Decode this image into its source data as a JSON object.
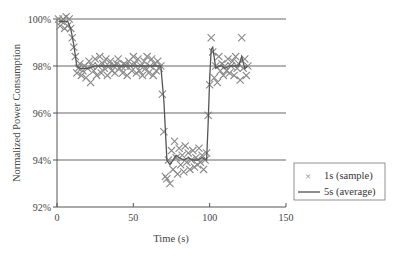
{
  "chart_data": {
    "type": "scatter",
    "title": "",
    "xlabel": "Time (s)",
    "ylabel": "Normalized Power Consumption",
    "xlim": [
      0,
      150
    ],
    "ylim": [
      92,
      100
    ],
    "x_ticks": [
      0,
      50,
      100,
      150
    ],
    "x_tick_labels": [
      "0",
      "50",
      "100",
      "150"
    ],
    "y_ticks": [
      92,
      94,
      96,
      98,
      100
    ],
    "y_tick_labels": [
      "92%",
      "94%",
      "96%",
      "98%",
      "100%"
    ],
    "grid": "horizontal",
    "legend_position": "right",
    "series": [
      {
        "name": "1s (sample)",
        "kind": "scatter",
        "marker": "x",
        "color": "#888888",
        "points": [
          [
            1,
            100.0
          ],
          [
            2,
            99.7
          ],
          [
            3,
            99.9
          ],
          [
            4,
            100.0
          ],
          [
            5,
            99.6
          ],
          [
            6,
            100.1
          ],
          [
            7,
            99.7
          ],
          [
            8,
            100.0
          ],
          [
            9,
            99.6
          ],
          [
            10,
            99.2
          ],
          [
            11,
            98.8
          ],
          [
            12,
            98.4
          ],
          [
            13,
            97.7
          ],
          [
            14,
            97.9
          ],
          [
            15,
            98.1
          ],
          [
            16,
            97.6
          ],
          [
            17,
            97.8
          ],
          [
            18,
            98.0
          ],
          [
            19,
            97.5
          ],
          [
            20,
            97.9
          ],
          [
            21,
            98.2
          ],
          [
            22,
            97.3
          ],
          [
            23,
            98.0
          ],
          [
            24,
            97.8
          ],
          [
            25,
            98.3
          ],
          [
            26,
            97.6
          ],
          [
            27,
            98.0
          ],
          [
            28,
            98.4
          ],
          [
            29,
            97.7
          ],
          [
            30,
            98.1
          ],
          [
            31,
            97.9
          ],
          [
            32,
            98.3
          ],
          [
            33,
            97.6
          ],
          [
            34,
            98.0
          ],
          [
            35,
            98.2
          ],
          [
            36,
            97.8
          ],
          [
            37,
            98.0
          ],
          [
            38,
            97.7
          ],
          [
            39,
            98.1
          ],
          [
            40,
            98.3
          ],
          [
            41,
            97.9
          ],
          [
            42,
            98.0
          ],
          [
            43,
            97.7
          ],
          [
            44,
            98.1
          ],
          [
            45,
            98.0
          ],
          [
            46,
            97.6
          ],
          [
            47,
            98.2
          ],
          [
            48,
            98.0
          ],
          [
            49,
            97.8
          ],
          [
            50,
            98.4
          ],
          [
            51,
            98.1
          ],
          [
            52,
            97.7
          ],
          [
            53,
            98.3
          ],
          [
            54,
            97.8
          ],
          [
            55,
            98.0
          ],
          [
            56,
            97.6
          ],
          [
            57,
            98.2
          ],
          [
            58,
            97.9
          ],
          [
            59,
            98.4
          ],
          [
            60,
            97.7
          ],
          [
            61,
            98.0
          ],
          [
            62,
            98.3
          ],
          [
            63,
            97.6
          ],
          [
            64,
            98.1
          ],
          [
            65,
            97.8
          ],
          [
            66,
            98.2
          ],
          [
            67,
            97.9
          ],
          [
            68,
            98.0
          ],
          [
            69,
            96.8
          ],
          [
            70,
            95.2
          ],
          [
            71,
            93.3
          ],
          [
            72,
            93.2
          ],
          [
            73,
            94.0
          ],
          [
            74,
            93.0
          ],
          [
            75,
            94.4
          ],
          [
            76,
            93.6
          ],
          [
            77,
            94.8
          ],
          [
            78,
            94.1
          ],
          [
            79,
            93.4
          ],
          [
            80,
            94.5
          ],
          [
            81,
            93.8
          ],
          [
            82,
            94.2
          ],
          [
            83,
            93.5
          ],
          [
            84,
            94.6
          ],
          [
            85,
            93.9
          ],
          [
            86,
            94.3
          ],
          [
            87,
            93.6
          ],
          [
            88,
            94.0
          ],
          [
            89,
            94.4
          ],
          [
            90,
            93.7
          ],
          [
            91,
            94.1
          ],
          [
            92,
            93.8
          ],
          [
            93,
            94.5
          ],
          [
            94,
            93.9
          ],
          [
            95,
            94.2
          ],
          [
            96,
            93.6
          ],
          [
            97,
            94.0
          ],
          [
            98,
            94.3
          ],
          [
            99,
            95.9
          ],
          [
            100,
            97.2
          ],
          [
            101,
            99.2
          ],
          [
            102,
            98.6
          ],
          [
            103,
            97.5
          ],
          [
            104,
            98.0
          ],
          [
            105,
            97.3
          ],
          [
            106,
            98.4
          ],
          [
            107,
            97.8
          ],
          [
            108,
            98.1
          ],
          [
            109,
            97.6
          ],
          [
            110,
            98.0
          ],
          [
            111,
            97.8
          ],
          [
            112,
            98.3
          ],
          [
            113,
            97.7
          ],
          [
            114,
            98.0
          ],
          [
            115,
            98.2
          ],
          [
            116,
            97.6
          ],
          [
            117,
            98.4
          ],
          [
            118,
            97.9
          ],
          [
            119,
            98.1
          ],
          [
            120,
            97.4
          ],
          [
            121,
            99.2
          ],
          [
            122,
            97.9
          ],
          [
            123,
            98.3
          ],
          [
            124,
            97.6
          ],
          [
            125,
            98.0
          ]
        ]
      },
      {
        "name": "5s (average)",
        "kind": "line",
        "color": "#555555",
        "points": [
          [
            1,
            99.9
          ],
          [
            3,
            99.9
          ],
          [
            5,
            99.9
          ],
          [
            7,
            99.9
          ],
          [
            9,
            99.6
          ],
          [
            11,
            98.9
          ],
          [
            13,
            98.0
          ],
          [
            15,
            97.9
          ],
          [
            17,
            97.9
          ],
          [
            20,
            97.9
          ],
          [
            25,
            98.0
          ],
          [
            30,
            98.0
          ],
          [
            35,
            98.0
          ],
          [
            40,
            98.0
          ],
          [
            45,
            98.0
          ],
          [
            50,
            98.0
          ],
          [
            55,
            98.0
          ],
          [
            60,
            98.0
          ],
          [
            65,
            98.0
          ],
          [
            68,
            98.0
          ],
          [
            70,
            96.5
          ],
          [
            72,
            94.0
          ],
          [
            74,
            93.8
          ],
          [
            76,
            94.0
          ],
          [
            78,
            94.2
          ],
          [
            80,
            94.1
          ],
          [
            83,
            94.0
          ],
          [
            86,
            94.1
          ],
          [
            89,
            94.0
          ],
          [
            92,
            94.0
          ],
          [
            95,
            94.1
          ],
          [
            98,
            94.0
          ],
          [
            99,
            95.5
          ],
          [
            100,
            97.5
          ],
          [
            101,
            98.7
          ],
          [
            102,
            98.8
          ],
          [
            104,
            97.9
          ],
          [
            106,
            98.0
          ],
          [
            108,
            98.0
          ],
          [
            110,
            97.9
          ],
          [
            113,
            98.0
          ],
          [
            116,
            98.0
          ],
          [
            119,
            98.0
          ],
          [
            121,
            98.4
          ],
          [
            123,
            97.9
          ],
          [
            125,
            98.0
          ]
        ]
      }
    ]
  },
  "legend": {
    "items": [
      {
        "label": "1s (sample)",
        "symbol": "×"
      },
      {
        "label": "5s (average)",
        "symbol": "line"
      }
    ]
  },
  "axes": {
    "x_title": "Time (s)",
    "y_title": "Normalized Power Consumption"
  }
}
